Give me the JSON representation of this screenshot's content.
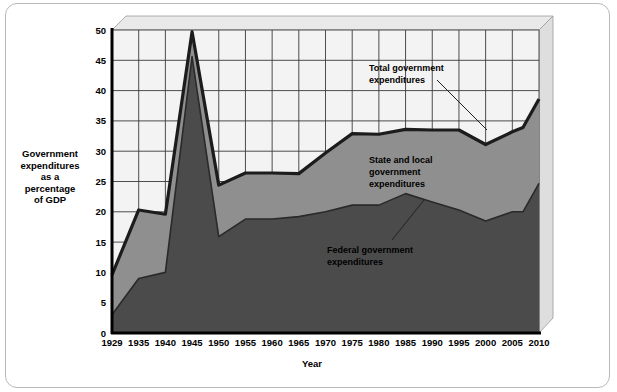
{
  "figure": {
    "y_axis_title": "Government\nexpenditures\nas a\npercentage\nof GDP",
    "x_axis_title": "Year"
  },
  "annotations": {
    "total": {
      "line1": "Total government",
      "line2": "expenditures"
    },
    "state_local": {
      "line1": "State and local",
      "line2": "government",
      "line3": "expenditures"
    },
    "federal": {
      "line1": "Federal government",
      "line2": "expenditures"
    }
  },
  "colors": {
    "total_band": "#8f8f8f",
    "federal_band": "#4b4b4b",
    "plot_background": "#f2f2f2",
    "grid": "#3a3a3a",
    "axis": "#000000",
    "frame": "#b9b9b9",
    "bevel_top": "#e8e8e8",
    "bevel_right": "#dcdcdc"
  },
  "chart_data": {
    "type": "area",
    "title": "",
    "subtitle": "",
    "xlabel": "Year",
    "ylabel": "Government expenditures as a percentage of GDP",
    "xlim": [
      1929,
      2010
    ],
    "ylim": [
      0,
      50
    ],
    "yticks": [
      0,
      5,
      10,
      15,
      20,
      25,
      30,
      35,
      40,
      45,
      50
    ],
    "xticks": [
      1929,
      1935,
      1940,
      1945,
      1950,
      1955,
      1960,
      1965,
      1970,
      1975,
      1980,
      1985,
      1990,
      1995,
      2000,
      2005,
      2010
    ],
    "grid": true,
    "legend": "annotations-inline",
    "x": [
      1929,
      1935,
      1940,
      1945,
      1950,
      1955,
      1960,
      1965,
      1970,
      1975,
      1980,
      1985,
      1990,
      1995,
      2000,
      2005,
      2007,
      2010
    ],
    "series": [
      {
        "name": "Total government expenditures",
        "values": [
          9.6,
          20.3,
          19.6,
          49.7,
          24.4,
          26.4,
          26.4,
          26.3,
          29.7,
          32.9,
          32.8,
          33.6,
          33.5,
          33.5,
          31.1,
          33.2,
          33.9,
          38.6
        ]
      },
      {
        "name": "Federal government expenditures",
        "values": [
          3.0,
          9.0,
          10.0,
          45.6,
          15.9,
          18.8,
          18.8,
          19.2,
          20.0,
          21.1,
          21.1,
          23.0,
          21.6,
          20.3,
          18.5,
          20.0,
          20.0,
          24.7
        ]
      },
      {
        "name": "State and local government expenditures",
        "values": [
          6.6,
          11.3,
          9.6,
          4.1,
          8.5,
          7.6,
          7.6,
          7.1,
          9.7,
          11.8,
          11.7,
          10.6,
          11.9,
          13.2,
          12.6,
          13.2,
          13.9,
          13.9
        ]
      }
    ]
  }
}
